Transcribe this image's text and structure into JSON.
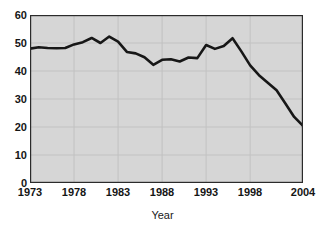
{
  "chart_data": {
    "type": "line",
    "title": "",
    "xlabel": "Year",
    "ylabel": "",
    "xlim": [
      1973,
      2004
    ],
    "ylim": [
      0,
      60
    ],
    "grid": true,
    "legend": null,
    "x_ticks": [
      "1973",
      "1978",
      "1983",
      "1988",
      "1993",
      "1998",
      "2004"
    ],
    "x_tick_values": [
      1973,
      1978,
      1983,
      1988,
      1993,
      1998,
      2004
    ],
    "y_ticks": [
      "0",
      "10",
      "20",
      "30",
      "40",
      "50",
      "60"
    ],
    "y_tick_values": [
      0,
      10,
      20,
      30,
      40,
      50,
      60
    ],
    "x": [
      1973,
      1974,
      1975,
      1976,
      1977,
      1978,
      1979,
      1980,
      1981,
      1982,
      1983,
      1984,
      1985,
      1986,
      1987,
      1988,
      1989,
      1990,
      1991,
      1992,
      1993,
      1994,
      1995,
      1996,
      1997,
      1998,
      1999,
      2000,
      2001,
      2002,
      2003,
      2004
    ],
    "values": [
      48.0,
      48.5,
      48.2,
      48.1,
      48.2,
      49.5,
      50.3,
      51.8,
      50.0,
      52.3,
      50.5,
      46.8,
      46.3,
      44.9,
      42.2,
      44.0,
      44.2,
      43.4,
      44.8,
      44.6,
      49.3,
      47.9,
      48.9,
      51.7,
      47.0,
      42.0,
      38.5,
      35.8,
      33.1,
      28.4,
      23.6,
      20.4
    ],
    "series_color": "#171717",
    "plot_background": "#d6d6d6",
    "gridline_color": "#c2c2c2",
    "axis_color": "#2b2b2b",
    "line_width": 2.6
  },
  "axis_title": {
    "x": "Year"
  }
}
